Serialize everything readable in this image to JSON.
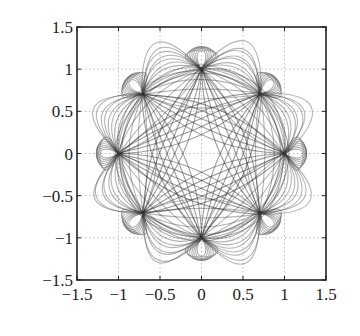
{
  "chart_data": {
    "type": "line",
    "title": "",
    "xlabel": "",
    "ylabel": "",
    "xlim": [
      -1.5,
      1.5
    ],
    "ylim": [
      -1.5,
      1.5
    ],
    "grid": true,
    "legend": null,
    "xticks": [
      -1.5,
      -1,
      -0.5,
      0,
      0.5,
      1,
      1.5
    ],
    "yticks": [
      -1.5,
      -1,
      -0.5,
      0,
      0.5,
      1,
      1.5
    ],
    "xtick_labels": [
      "−1.5",
      "−1",
      "−0.5",
      "0",
      "0.5",
      "1",
      "1.5"
    ],
    "ytick_labels": [
      "−1.5",
      "−1",
      "−0.5",
      "0",
      "0.5",
      "1",
      "1.5"
    ],
    "nodes": [
      {
        "x": 1,
        "y": 0
      },
      {
        "x": 0.707,
        "y": 0.707
      },
      {
        "x": 0,
        "y": 1
      },
      {
        "x": -0.707,
        "y": 0.707
      },
      {
        "x": -1,
        "y": 0
      },
      {
        "x": -0.707,
        "y": -0.707
      },
      {
        "x": 0,
        "y": -1
      },
      {
        "x": 0.707,
        "y": -0.707
      }
    ],
    "series": [
      {
        "name": "outer-loops-adjacent",
        "description": "arcs between adjacent nodes (i, i+1), bulging outward",
        "node_step": 1,
        "bulge_factors": [
          0.05,
          0.12,
          0.2,
          0.28,
          0.36,
          0.44,
          0.52,
          0.6,
          0.7,
          0.8
        ]
      },
      {
        "name": "loops-skip-one",
        "description": "arcs between nodes (i, i+2), bulging outward",
        "node_step": 2,
        "bulge_factors": [
          -0.15,
          -0.05,
          0.05,
          0.15,
          0.22,
          0.3
        ]
      },
      {
        "name": "star-chords",
        "description": "chords between nodes (i, i+3), slight curvature",
        "node_step": 3,
        "bulge_factors": [
          -0.12,
          -0.06,
          0,
          0.06,
          0.12
        ]
      }
    ],
    "outer_envelope_radius": 1.27,
    "inner_clear_radius": 0.35
  }
}
